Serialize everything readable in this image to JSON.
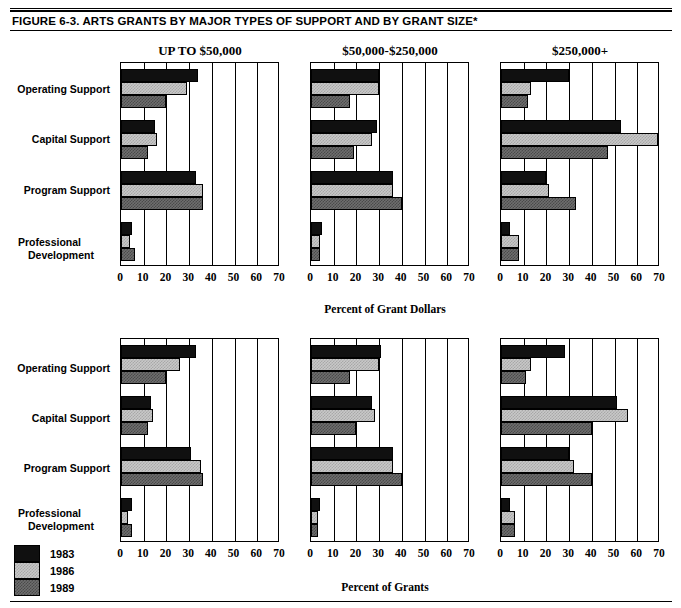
{
  "figure": {
    "title": "FIGURE  6-3.  ARTS GRANTS BY MAJOR TYPES OF SUPPORT AND BY GRANT SIZE*"
  },
  "column_headings": [
    "UP TO $50,000",
    "$50,000-$250,000",
    "$250,000+"
  ],
  "categories": [
    "Operating Support",
    "Capital Support",
    "Program Support",
    "Professional Development"
  ],
  "category_lines": {
    "c0": "Operating Support",
    "c1": "Capital Support",
    "c2": "Program Support",
    "c3a": "Professional",
    "c3b": "Development"
  },
  "legend": {
    "items": [
      {
        "label": "1983",
        "swatch": "solid-black"
      },
      {
        "label": "1986",
        "swatch": "light-checker"
      },
      {
        "label": "1989",
        "swatch": "dark-checker"
      }
    ]
  },
  "axis": {
    "ticks": [
      "0",
      "10",
      "20",
      "30",
      "40",
      "50",
      "60",
      "70"
    ],
    "tick_values": [
      0,
      10,
      20,
      30,
      40,
      50,
      60,
      70
    ],
    "min": 0,
    "max": 70,
    "top_row_title": "Percent of Grant Dollars",
    "bottom_row_title": "Percent of Grants"
  },
  "colors": {
    "series_1983": "#101010",
    "series_1986": "#c8c8c8",
    "series_1989": "#6e6e6e",
    "axis": "#000000",
    "background": "#ffffff"
  },
  "chart_data": [
    {
      "type": "bar",
      "orientation": "horizontal",
      "title": "UP TO $50,000",
      "subtitle": "Percent of Grant Dollars",
      "row": "top",
      "panel_index": 0,
      "xlabel": "Percent of Grant Dollars",
      "ylabel": "",
      "xlim": [
        0,
        70
      ],
      "grid": true,
      "legend_position": "bottom-left-of-figure",
      "categories": [
        "Operating Support",
        "Capital Support",
        "Program Support",
        "Professional Development"
      ],
      "series": [
        {
          "name": "1983",
          "values": [
            34,
            15,
            33,
            5
          ]
        },
        {
          "name": "1986",
          "values": [
            29,
            16,
            36,
            4
          ]
        },
        {
          "name": "1989",
          "values": [
            20,
            12,
            36,
            6
          ]
        }
      ]
    },
    {
      "type": "bar",
      "orientation": "horizontal",
      "title": "$50,000-$250,000",
      "subtitle": "Percent of Grant Dollars",
      "row": "top",
      "panel_index": 1,
      "xlabel": "Percent of Grant Dollars",
      "ylabel": "",
      "xlim": [
        0,
        70
      ],
      "grid": true,
      "legend_position": "bottom-left-of-figure",
      "categories": [
        "Operating Support",
        "Capital Support",
        "Program Support",
        "Professional Development"
      ],
      "series": [
        {
          "name": "1983",
          "values": [
            30,
            29,
            36,
            5
          ]
        },
        {
          "name": "1986",
          "values": [
            30,
            27,
            36,
            4
          ]
        },
        {
          "name": "1989",
          "values": [
            17,
            19,
            40,
            4
          ]
        }
      ]
    },
    {
      "type": "bar",
      "orientation": "horizontal",
      "title": "$250,000+",
      "subtitle": "Percent of Grant Dollars",
      "row": "top",
      "panel_index": 2,
      "xlabel": "Percent of Grant Dollars",
      "ylabel": "",
      "xlim": [
        0,
        70
      ],
      "grid": true,
      "legend_position": "bottom-left-of-figure",
      "categories": [
        "Operating Support",
        "Capital Support",
        "Program Support",
        "Professional Development"
      ],
      "series": [
        {
          "name": "1983",
          "values": [
            30,
            53,
            20,
            4
          ]
        },
        {
          "name": "1986",
          "values": [
            13,
            69,
            21,
            8
          ]
        },
        {
          "name": "1989",
          "values": [
            12,
            47,
            33,
            8
          ]
        }
      ]
    },
    {
      "type": "bar",
      "orientation": "horizontal",
      "title": "UP TO $50,000",
      "subtitle": "Percent of Grants",
      "row": "bottom",
      "panel_index": 0,
      "xlabel": "Percent of Grants",
      "ylabel": "",
      "xlim": [
        0,
        70
      ],
      "grid": true,
      "legend_position": "bottom-left-of-figure",
      "categories": [
        "Operating Support",
        "Capital Support",
        "Program Support",
        "Professional Development"
      ],
      "series": [
        {
          "name": "1983",
          "values": [
            33,
            13,
            31,
            5
          ]
        },
        {
          "name": "1986",
          "values": [
            26,
            14,
            35,
            3
          ]
        },
        {
          "name": "1989",
          "values": [
            20,
            12,
            36,
            5
          ]
        }
      ]
    },
    {
      "type": "bar",
      "orientation": "horizontal",
      "title": "$50,000-$250,000",
      "subtitle": "Percent of Grants",
      "row": "bottom",
      "panel_index": 1,
      "xlabel": "Percent of Grants",
      "ylabel": "",
      "xlim": [
        0,
        70
      ],
      "grid": true,
      "legend_position": "bottom-left-of-figure",
      "categories": [
        "Operating Support",
        "Capital Support",
        "Program Support",
        "Professional Development"
      ],
      "series": [
        {
          "name": "1983",
          "values": [
            31,
            27,
            36,
            4
          ]
        },
        {
          "name": "1986",
          "values": [
            30,
            28,
            36,
            3
          ]
        },
        {
          "name": "1989",
          "values": [
            17,
            20,
            40,
            3
          ]
        }
      ]
    },
    {
      "type": "bar",
      "orientation": "horizontal",
      "title": "$250,000+",
      "subtitle": "Percent of Grants",
      "row": "bottom",
      "panel_index": 2,
      "xlabel": "Percent of Grants",
      "ylabel": "",
      "xlim": [
        0,
        70
      ],
      "grid": true,
      "legend_position": "bottom-left-of-figure",
      "categories": [
        "Operating Support",
        "Capital Support",
        "Program Support",
        "Professional Development"
      ],
      "series": [
        {
          "name": "1983",
          "values": [
            28,
            51,
            30,
            4
          ]
        },
        {
          "name": "1986",
          "values": [
            13,
            56,
            32,
            6
          ]
        },
        {
          "name": "1989",
          "values": [
            11,
            40,
            40,
            6
          ]
        }
      ]
    }
  ]
}
